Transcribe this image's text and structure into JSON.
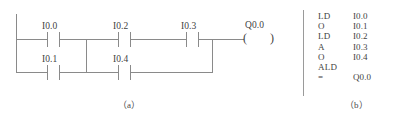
{
  "figure": {
    "panel_a": {
      "caption": "（a）",
      "type": "ladder-diagram",
      "rungs": [
        {
          "row": "top",
          "contacts": [
            {
              "label": "I0.0",
              "kind": "normally-open"
            },
            {
              "label": "I0.2",
              "kind": "normally-open"
            },
            {
              "label": "I0.3",
              "kind": "normally-open"
            }
          ],
          "coil": {
            "label": "Q0.0",
            "kind": "output-coil",
            "glyph_left": "(",
            "glyph_right": ")"
          }
        },
        {
          "row": "bottom",
          "contacts": [
            {
              "label": "I0.1",
              "kind": "normally-open"
            },
            {
              "label": "I0.4",
              "kind": "normally-open"
            }
          ]
        }
      ],
      "labels": {
        "i00": "I0.0",
        "i01": "I0.1",
        "i02": "I0.2",
        "i03": "I0.3",
        "i04": "I0.4",
        "q00": "Q0.0"
      },
      "coil_glyphs": {
        "left": "(",
        "right": ")"
      }
    },
    "panel_b": {
      "caption": "（b）",
      "type": "instruction-list",
      "instructions": [
        {
          "op": "LD",
          "operand": "I0.0"
        },
        {
          "op": "O",
          "operand": "I0.1"
        },
        {
          "op": "LD",
          "operand": "I0.2"
        },
        {
          "op": "A",
          "operand": "I0.3"
        },
        {
          "op": "O",
          "operand": "I0.4"
        },
        {
          "op": "ALD",
          "operand": ""
        },
        {
          "op": "=",
          "operand": "Q0.0"
        }
      ]
    }
  },
  "colors": {
    "line": "#8a8a8a",
    "text": "#3f3f3f",
    "background": "#ffffff"
  }
}
